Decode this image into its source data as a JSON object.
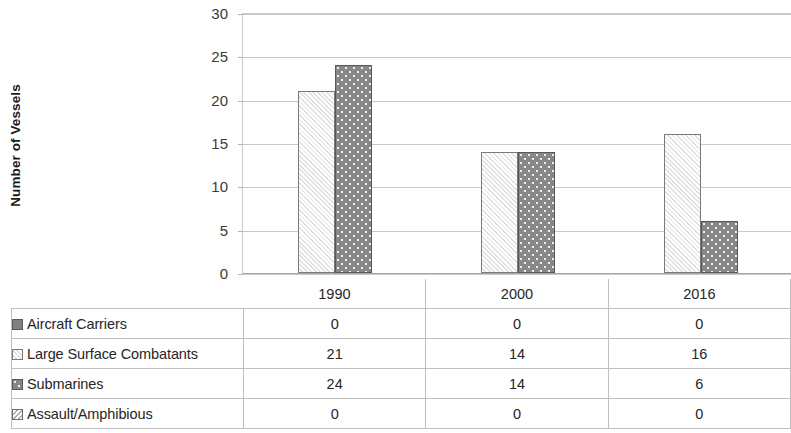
{
  "chart_data": {
    "type": "bar",
    "title": "",
    "xlabel": "",
    "ylabel": "Number of Vessels",
    "categories": [
      "1990",
      "2000",
      "2016"
    ],
    "series": [
      {
        "name": "Aircraft Carriers",
        "values": [
          0,
          0,
          0
        ],
        "swatch": "solid-gray-square",
        "color": "#808080",
        "pattern": "solid"
      },
      {
        "name": "Large Surface Combatants",
        "values": [
          21,
          14,
          16
        ],
        "swatch": "light-diagonal-hatch-square",
        "color": "#f4f4f4",
        "pattern": "diagonal-hatch"
      },
      {
        "name": "Submarines",
        "values": [
          24,
          14,
          6
        ],
        "swatch": "dark-gray-dotted-square",
        "color": "#878787",
        "pattern": "dots"
      },
      {
        "name": "Assault/Amphibious",
        "values": [
          0,
          0,
          0
        ],
        "swatch": "white-diagonal-square",
        "color": "#ffffff",
        "pattern": "diagonal"
      }
    ],
    "ylim": [
      0,
      30
    ],
    "yticks": [
      0,
      5,
      10,
      15,
      20,
      25,
      30
    ],
    "ytick_labels": [
      "0",
      "5",
      "10",
      "15",
      "20",
      "25",
      "30"
    ],
    "grid": true,
    "grid_axis": "y",
    "legend_position": "data-table-below",
    "gridline_color": "#c9c9c9",
    "axis_color": "#a6a6a6"
  },
  "table": {
    "header_blank": "",
    "columns": [
      "1990",
      "2000",
      "2016"
    ],
    "rows": [
      {
        "label": "Aircraft Carriers",
        "values": [
          "0",
          "0",
          "0"
        ]
      },
      {
        "label": "Large Surface Combatants",
        "values": [
          "21",
          "14",
          "16"
        ]
      },
      {
        "label": "Submarines",
        "values": [
          "24",
          "14",
          "6"
        ]
      },
      {
        "label": "Assault/Amphibious",
        "values": [
          "0",
          "0",
          "0"
        ]
      }
    ]
  }
}
